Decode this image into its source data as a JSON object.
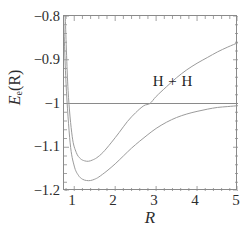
{
  "chart_data": {
    "type": "line",
    "title": "",
    "xlabel": "R",
    "ylabel": "E_e(R)",
    "ylabel_base": "E",
    "ylabel_sub": "e",
    "ylabel_arg": "(R)",
    "xlim": [
      0.75,
      5
    ],
    "ylim": [
      -1.2,
      -0.8
    ],
    "xticks": [
      1,
      2,
      3,
      4,
      5
    ],
    "xticklabels": [
      "1",
      "2",
      "3",
      "4",
      "5"
    ],
    "yticks": [
      -0.8,
      -0.9,
      -1,
      -1.1,
      -1.2
    ],
    "yticklabels": [
      "−0.8",
      "−0.9",
      "−1",
      "−1.1",
      "−1.2"
    ],
    "grid": false,
    "legend_position": "none",
    "minor_ticks": true,
    "annotations": [
      {
        "text": "H + H",
        "x": 3.55,
        "y": -0.972
      }
    ],
    "series": [
      {
        "name": "asymptote-H-plus-H",
        "style": "horizontal-line",
        "color": "#8a8a8a",
        "y_constant": -1.0,
        "x": [
          0.75,
          5
        ],
        "values": [
          -1.0,
          -1.0
        ]
      },
      {
        "name": "upper-curve",
        "style": "solid",
        "color": "#9b9b9b",
        "x": [
          0.78,
          0.85,
          0.95,
          1.05,
          1.15,
          1.25,
          1.35,
          1.45,
          1.55,
          1.7,
          1.9,
          2.1,
          2.3,
          2.5,
          2.7,
          2.85,
          3.0,
          3.25,
          3.5,
          3.75,
          4.0,
          4.25,
          4.5,
          4.75,
          5.0
        ],
        "values": [
          -0.8,
          -0.97,
          -1.075,
          -1.112,
          -1.126,
          -1.131,
          -1.132,
          -1.129,
          -1.124,
          -1.112,
          -1.09,
          -1.066,
          -1.041,
          -1.021,
          -1.005,
          -1.0,
          -0.984,
          -0.962,
          -0.941,
          -0.923,
          -0.908,
          -0.895,
          -0.882,
          -0.871,
          -0.861
        ]
      },
      {
        "name": "lower-curve",
        "style": "solid",
        "color": "#9b9b9b",
        "x": [
          0.74,
          0.8,
          0.9,
          1.0,
          1.1,
          1.2,
          1.3,
          1.4,
          1.5,
          1.6,
          1.8,
          2.0,
          2.2,
          2.4,
          2.6,
          2.8,
          3.0,
          3.25,
          3.5,
          3.75,
          4.0,
          4.25,
          4.5,
          4.75,
          5.0
        ],
        "values": [
          -0.8,
          -0.955,
          -1.09,
          -1.143,
          -1.164,
          -1.173,
          -1.176,
          -1.176,
          -1.173,
          -1.168,
          -1.154,
          -1.138,
          -1.12,
          -1.102,
          -1.086,
          -1.071,
          -1.057,
          -1.043,
          -1.032,
          -1.024,
          -1.018,
          -1.013,
          -1.009,
          -1.007,
          -1.005
        ]
      }
    ]
  }
}
